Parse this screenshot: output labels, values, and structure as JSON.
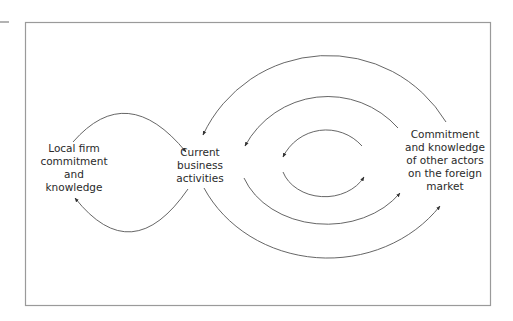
{
  "diagram": {
    "frame": {
      "stroke": "#9a9a9a"
    },
    "arrow_color": "#555555",
    "nodes": {
      "local": {
        "lines": [
          "Local firm",
          "commitment",
          "and",
          "knowledge"
        ]
      },
      "current": {
        "lines": [
          "Current",
          "business",
          "activities"
        ]
      },
      "foreign": {
        "lines": [
          "Commitment",
          "and knowledge",
          "of other actors",
          "on the foreign",
          "market"
        ]
      }
    },
    "edges": [
      {
        "from": "local",
        "to": "current",
        "loop": "left-top"
      },
      {
        "from": "current",
        "to": "local",
        "loop": "left-bottom"
      },
      {
        "from": "foreign",
        "to": "current",
        "ring": "outer-top"
      },
      {
        "from": "current",
        "to": "foreign",
        "ring": "outer-bottom"
      },
      {
        "from": "foreign",
        "to": "current",
        "ring": "middle-top"
      },
      {
        "from": "current",
        "to": "foreign",
        "ring": "middle-bottom"
      },
      {
        "from": "foreign",
        "to": "current",
        "ring": "inner-top"
      },
      {
        "from": "current",
        "to": "foreign",
        "ring": "inner-bottom"
      }
    ]
  }
}
